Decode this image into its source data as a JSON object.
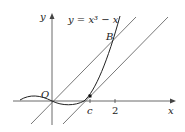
{
  "diagram": {
    "equation_label": "y = x³ − x",
    "axis_labels": {
      "x": "x",
      "y": "y"
    },
    "origin_label": "O",
    "point_label": "B",
    "tick_labels": [
      "c",
      "2"
    ],
    "colors": {
      "curve": "#222222",
      "lines": "#555555",
      "axes": "#444444"
    }
  }
}
